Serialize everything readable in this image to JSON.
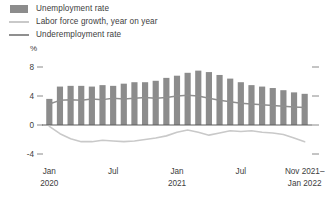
{
  "legend": {
    "items": [
      {
        "label": "Unemployment rate",
        "key": "bar-swatch",
        "color": "#8c8c8c"
      },
      {
        "label": "Labor force growth, year on year",
        "key": "line-swatch-light",
        "color": "#c9c9c9"
      },
      {
        "label": "Underemployment rate",
        "key": "line-swatch-dark",
        "color": "#8f8f8f"
      }
    ]
  },
  "axis": {
    "unit": "%",
    "y_ticks": [
      "8",
      "4",
      "0",
      "-4"
    ],
    "x_ticks": [
      {
        "line1": "Jan",
        "line2": "2020"
      },
      {
        "line1": "Jul",
        "line2": ""
      },
      {
        "line1": "Jan",
        "line2": "2021"
      },
      {
        "line1": "Jul",
        "line2": ""
      },
      {
        "line1": "Nov 2021–",
        "line2": "Jan 2022"
      }
    ]
  },
  "chart_data": {
    "type": "bar",
    "title": "",
    "subtitle": "",
    "xlabel": "",
    "ylabel": "%",
    "ylim": [
      -4,
      8
    ],
    "y_ticks": [
      8,
      4,
      0,
      -4
    ],
    "grid": false,
    "legend_position": "top-left",
    "categories": [
      "Jan 2020",
      "Feb 2020",
      "Mar 2020",
      "Apr 2020",
      "May 2020",
      "Jun 2020",
      "Jul 2020",
      "Aug 2020",
      "Sep 2020",
      "Oct 2020",
      "Nov 2020",
      "Dec 2020",
      "Jan 2021",
      "Feb 2021",
      "Mar 2021",
      "Apr 2021",
      "May 2021",
      "Jun 2021",
      "Jul 2021",
      "Aug 2021",
      "Sep 2021",
      "Oct 2021",
      "Nov 2021",
      "Dec 2021",
      "Jan 2022"
    ],
    "series": [
      {
        "name": "Unemployment rate",
        "type": "bar",
        "color": "#8c8c8c",
        "values": [
          3.6,
          5.3,
          5.4,
          5.4,
          5.3,
          5.5,
          5.4,
          5.7,
          5.9,
          5.9,
          6.1,
          6.5,
          6.8,
          7.2,
          7.5,
          7.3,
          6.9,
          6.4,
          5.9,
          5.5,
          5.3,
          5.1,
          4.8,
          4.5,
          4.3
        ]
      },
      {
        "name": "Labor force growth, year on year",
        "type": "line",
        "color": "#c9c9c9",
        "values": [
          -0.2,
          -1.2,
          -1.9,
          -2.3,
          -2.3,
          -2.1,
          -2.2,
          -2.3,
          -2.2,
          -2.0,
          -1.8,
          -1.5,
          -1.0,
          -0.7,
          -1.0,
          -1.4,
          -1.1,
          -0.8,
          -0.9,
          -0.8,
          -1.0,
          -1.1,
          -1.3,
          -1.8,
          -2.3
        ]
      },
      {
        "name": "Underemployment rate",
        "type": "line",
        "color": "#8f8f8f",
        "values": [
          2.9,
          3.4,
          3.5,
          3.4,
          3.6,
          3.5,
          3.7,
          3.6,
          3.7,
          3.8,
          3.7,
          3.8,
          4.0,
          4.1,
          4.0,
          3.7,
          3.4,
          3.2,
          3.0,
          2.9,
          2.8,
          2.7,
          2.6,
          2.5,
          2.4
        ]
      }
    ]
  }
}
